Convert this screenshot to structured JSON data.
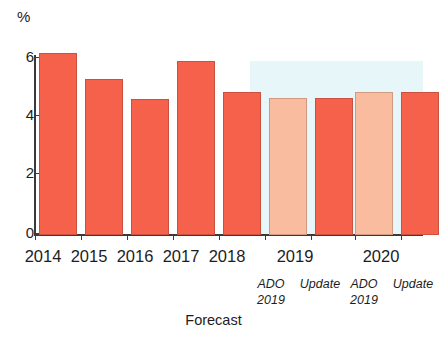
{
  "chart_data": {
    "type": "bar",
    "title": "",
    "subtitle": "",
    "xlabel": "",
    "ylabel": "%",
    "unit_label": "%",
    "ylim": [
      0,
      6
    ],
    "yticks": [
      0,
      2,
      4,
      6
    ],
    "ytick_labels": [
      "0",
      "2",
      "4",
      "6"
    ],
    "grid": false,
    "legend_position": "none",
    "categories": [
      "2014",
      "2015",
      "2016",
      "2017",
      "2018",
      "2019",
      "2020"
    ],
    "bars": [
      {
        "category": "2014",
        "series": "Actual",
        "value": 5.9,
        "color": "#f5614b",
        "style": "dark"
      },
      {
        "category": "2015",
        "series": "Actual",
        "value": 5.05,
        "color": "#f5614b",
        "style": "dark"
      },
      {
        "category": "2016",
        "series": "Actual",
        "value": 4.4,
        "color": "#f5614b",
        "style": "dark"
      },
      {
        "category": "2017",
        "series": "Actual",
        "value": 5.65,
        "color": "#f5614b",
        "style": "dark"
      },
      {
        "category": "2018",
        "series": "Actual",
        "value": 4.65,
        "color": "#f5614b",
        "style": "dark"
      },
      {
        "category": "2019",
        "series": "ADO 2019",
        "value": 4.45,
        "color": "#f9bc9e",
        "style": "light"
      },
      {
        "category": "2019",
        "series": "Update 2019",
        "value": 4.45,
        "color": "#f5614b",
        "style": "dark"
      },
      {
        "category": "2020",
        "series": "ADO 2019",
        "value": 4.65,
        "color": "#f9bc9e",
        "style": "light"
      },
      {
        "category": "2020",
        "series": "Update 2019",
        "value": 4.65,
        "color": "#f5614b",
        "style": "dark"
      }
    ],
    "series": [
      {
        "name": "Actual",
        "values": [
          5.9,
          5.05,
          4.4,
          5.65,
          4.65,
          null,
          null
        ]
      },
      {
        "name": "ADO 2019",
        "values": [
          null,
          null,
          null,
          null,
          null,
          4.45,
          4.65
        ]
      },
      {
        "name": "Update 2019",
        "values": [
          null,
          null,
          null,
          null,
          null,
          4.45,
          4.65
        ]
      }
    ],
    "annotations": {
      "forecast_band_label": "Forecast",
      "forecast_band_categories": [
        "2019",
        "2020"
      ],
      "sublabels": [
        "ADO 2019",
        "Update 2019",
        "ADO 2019",
        "Update 2019"
      ]
    },
    "colors": {
      "bar_dark": "#f5614b",
      "bar_light": "#f9bc9e",
      "forecast_background": "#e7f6f8",
      "axis": "#3a3a3a",
      "text": "#1d1d1d"
    }
  },
  "axis": {
    "unit": "%",
    "ticks": [
      {
        "label": "6"
      },
      {
        "label": "4"
      },
      {
        "label": "2"
      },
      {
        "label": "0"
      }
    ]
  },
  "xlabels": {
    "years": [
      {
        "label": "2014"
      },
      {
        "label": "2015"
      },
      {
        "label": "2016"
      },
      {
        "label": "2017"
      },
      {
        "label": "2018"
      },
      {
        "label": "2019"
      },
      {
        "label": "2020"
      }
    ],
    "sub": [
      {
        "line1": "ADO",
        "line2": "2019"
      },
      {
        "line1": "Update",
        "line2": ""
      },
      {
        "line1": "ADO",
        "line2": "2019"
      },
      {
        "line1": "Update",
        "line2": ""
      }
    ],
    "forecast_caption": "Forecast"
  }
}
